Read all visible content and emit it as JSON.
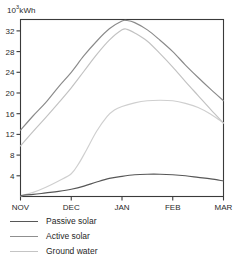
{
  "chart_data": {
    "type": "line",
    "title": "",
    "subtitle": "",
    "xlabel": "",
    "ylabel": "10³kWh",
    "unit_label_base": "10",
    "unit_label_exp": "3",
    "unit_label_suffix": "kWh",
    "categories": [
      "NOV",
      "DEC",
      "JAN",
      "FEB",
      "MAR"
    ],
    "x": [
      0,
      1,
      2,
      3,
      4
    ],
    "xlim": [
      0,
      4
    ],
    "ylim": [
      0,
      34.2
    ],
    "yticks": [
      4,
      8,
      12,
      16,
      20,
      24,
      28,
      32
    ],
    "xticks": [
      "NOV",
      "DEC",
      "JAN",
      "FEB",
      "MAR"
    ],
    "grid": false,
    "legend_position": "below-left",
    "series": [
      {
        "name": "Passive solar",
        "color": "#575757",
        "values": [
          0.2,
          1.4,
          3.9,
          4.3,
          3.0
        ],
        "points": [
          [
            0.0,
            0.2
          ],
          [
            0.25,
            0.4
          ],
          [
            0.5,
            0.7
          ],
          [
            0.75,
            1.0
          ],
          [
            1.0,
            1.4
          ],
          [
            1.25,
            2.0
          ],
          [
            1.5,
            2.8
          ],
          [
            1.75,
            3.5
          ],
          [
            2.0,
            3.9
          ],
          [
            2.25,
            4.2
          ],
          [
            2.5,
            4.3
          ],
          [
            2.75,
            4.3
          ],
          [
            3.0,
            4.2
          ],
          [
            3.25,
            4.0
          ],
          [
            3.5,
            3.7
          ],
          [
            3.75,
            3.4
          ],
          [
            4.0,
            3.0
          ]
        ]
      },
      {
        "name": "Active solar",
        "color": "#8a8a8a",
        "values": [
          12.8,
          24.0,
          33.9,
          28.0,
          18.5
        ],
        "points": [
          [
            0.0,
            12.8
          ],
          [
            0.25,
            15.6
          ],
          [
            0.5,
            18.2
          ],
          [
            0.75,
            21.2
          ],
          [
            1.0,
            24.0
          ],
          [
            1.25,
            27.2
          ],
          [
            1.5,
            30.0
          ],
          [
            1.75,
            32.4
          ],
          [
            2.0,
            33.9
          ],
          [
            2.1,
            34.0
          ],
          [
            2.25,
            33.6
          ],
          [
            2.5,
            32.2
          ],
          [
            2.75,
            30.2
          ],
          [
            3.0,
            28.0
          ],
          [
            3.25,
            25.4
          ],
          [
            3.5,
            23.0
          ],
          [
            3.75,
            20.7
          ],
          [
            4.0,
            18.5
          ]
        ]
      },
      {
        "name": "Ground water",
        "color": "#c2c2c2",
        "values": [
          9.8,
          21.0,
          32.2,
          25.0,
          14.2
        ],
        "points": [
          [
            0.0,
            9.8
          ],
          [
            0.25,
            12.6
          ],
          [
            0.5,
            15.3
          ],
          [
            0.75,
            18.1
          ],
          [
            1.0,
            21.0
          ],
          [
            1.25,
            24.2
          ],
          [
            1.5,
            27.4
          ],
          [
            1.75,
            30.2
          ],
          [
            2.0,
            32.2
          ],
          [
            2.1,
            32.3
          ],
          [
            2.25,
            31.6
          ],
          [
            2.5,
            30.0
          ],
          [
            2.75,
            27.6
          ],
          [
            3.0,
            25.0
          ],
          [
            3.25,
            22.2
          ],
          [
            3.5,
            19.5
          ],
          [
            3.75,
            16.8
          ],
          [
            4.0,
            14.2
          ]
        ]
      },
      {
        "name": "Ground water lower",
        "color": "#cfcfcf",
        "values": [
          0.1,
          4.4,
          17.4,
          18.6,
          14.2
        ],
        "points": [
          [
            0.0,
            0.1
          ],
          [
            0.25,
            0.8
          ],
          [
            0.5,
            1.8
          ],
          [
            0.75,
            3.0
          ],
          [
            1.0,
            4.4
          ],
          [
            1.15,
            6.4
          ],
          [
            1.3,
            9.0
          ],
          [
            1.5,
            12.6
          ],
          [
            1.7,
            15.4
          ],
          [
            1.85,
            16.7
          ],
          [
            2.0,
            17.4
          ],
          [
            2.25,
            18.1
          ],
          [
            2.5,
            18.5
          ],
          [
            2.75,
            18.6
          ],
          [
            3.0,
            18.5
          ],
          [
            3.25,
            18.0
          ],
          [
            3.5,
            17.2
          ],
          [
            3.75,
            15.9
          ],
          [
            4.0,
            14.2
          ]
        ]
      }
    ]
  },
  "legend": {
    "items": [
      {
        "label": "Passive solar",
        "color": "#575757"
      },
      {
        "label": "Active solar",
        "color": "#8f8f8f"
      },
      {
        "label": "Ground water",
        "color": "#c4c4c4"
      }
    ]
  },
  "axes": {
    "frame_color": "#3a3a3a"
  }
}
